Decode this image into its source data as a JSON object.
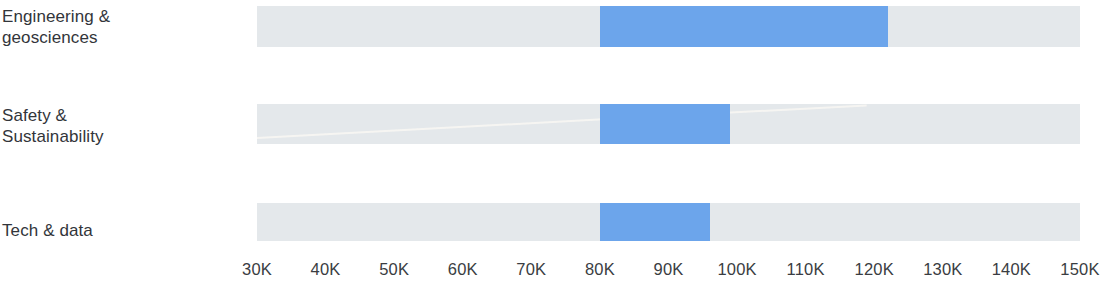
{
  "chart": {
    "type": "bar-range",
    "orientation": "horizontal",
    "title": "",
    "xlabel": "",
    "ylabel": "",
    "grid": false,
    "legend": false
  },
  "axis": {
    "ticks": [
      "30K",
      "40K",
      "50K",
      "60K",
      "70K",
      "80K",
      "90K",
      "100K",
      "110K",
      "120K",
      "130K",
      "140K",
      "150K"
    ],
    "tick_values": [
      30000,
      40000,
      50000,
      60000,
      70000,
      80000,
      90000,
      100000,
      110000,
      120000,
      130000,
      140000,
      150000
    ],
    "min": 30000,
    "max": 150000
  },
  "colors": {
    "track": "#e4e8eb",
    "fill": "#6ca5eb",
    "label_text": "#32353a",
    "tick_text": "#3a3d42",
    "background": "#ffffff"
  },
  "rows": [
    {
      "label": "Engineering &\ngeosciences",
      "range_start": 80000,
      "range_end": 122000,
      "track_start": 30000,
      "track_end": 150000
    },
    {
      "label": "Safety &\nSustainability",
      "range_start": 80000,
      "range_end": 99000,
      "track_start": 30000,
      "track_end": 150000
    },
    {
      "label": "Tech & data",
      "range_start": 80000,
      "range_end": 96000,
      "track_start": 30000,
      "track_end": 150000
    }
  ],
  "chart_data": {
    "type": "bar",
    "title": "",
    "xlabel": "",
    "ylabel": "",
    "orientation": "horizontal",
    "grid": false,
    "legend": false,
    "xlim": [
      30000,
      150000
    ],
    "xticks": [
      30000,
      40000,
      50000,
      60000,
      70000,
      80000,
      90000,
      100000,
      110000,
      120000,
      130000,
      140000,
      150000
    ],
    "xticklabels": [
      "30K",
      "40K",
      "50K",
      "60K",
      "70K",
      "80K",
      "90K",
      "100K",
      "110K",
      "120K",
      "130K",
      "140K",
      "150K"
    ],
    "categories": [
      "Engineering & geosciences",
      "Safety & Sustainability",
      "Tech & data"
    ],
    "series": [
      {
        "name": "Salary range",
        "ranges": [
          {
            "category": "Engineering & geosciences",
            "low": 80000,
            "high": 122000
          },
          {
            "category": "Safety & Sustainability",
            "low": 80000,
            "high": 99000
          },
          {
            "category": "Tech & data",
            "low": 80000,
            "high": 96000
          }
        ]
      }
    ]
  }
}
